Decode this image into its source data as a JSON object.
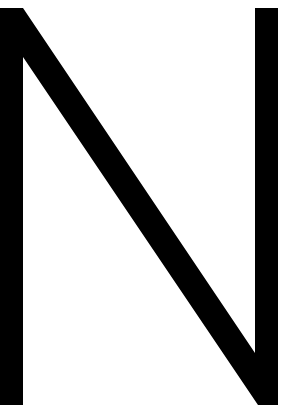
{
  "letter": {
    "character": "N",
    "color": "#000000",
    "background": "#ffffff"
  }
}
